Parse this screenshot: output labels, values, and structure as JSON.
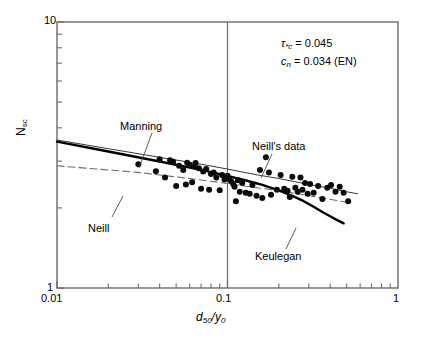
{
  "chart_data": {
    "type": "scatter",
    "title": "",
    "xlabel": "d50/y0",
    "ylabel": "Nsc",
    "xscale": "log",
    "yscale": "log",
    "xlim": [
      0.01,
      1
    ],
    "ylim": [
      1,
      10
    ],
    "grid": false,
    "xticklabels": [
      "0.01",
      "0.1",
      "1"
    ],
    "yticklabels": [
      "10",
      "1"
    ],
    "vertical_reference_line": 0.1,
    "legend_position": "inline-annotations",
    "series": [
      {
        "name": "Neill's data",
        "style": "scatter",
        "marker": "filled-circle",
        "points": [
          [
            0.03,
            2.92
          ],
          [
            0.038,
            2.75
          ],
          [
            0.04,
            3.05
          ],
          [
            0.043,
            2.6
          ],
          [
            0.046,
            3.02
          ],
          [
            0.048,
            2.98
          ],
          [
            0.05,
            2.42
          ],
          [
            0.052,
            2.88
          ],
          [
            0.055,
            2.78
          ],
          [
            0.057,
            2.45
          ],
          [
            0.058,
            2.96
          ],
          [
            0.06,
            2.9
          ],
          [
            0.062,
            2.5
          ],
          [
            0.064,
            2.86
          ],
          [
            0.065,
            2.95
          ],
          [
            0.068,
            2.82
          ],
          [
            0.07,
            2.36
          ],
          [
            0.072,
            2.74
          ],
          [
            0.075,
            2.8
          ],
          [
            0.078,
            2.34
          ],
          [
            0.08,
            2.68
          ],
          [
            0.083,
            2.72
          ],
          [
            0.086,
            2.6
          ],
          [
            0.09,
            2.33
          ],
          [
            0.093,
            2.66
          ],
          [
            0.096,
            2.56
          ],
          [
            0.098,
            2.62
          ],
          [
            0.1,
            2.64
          ],
          [
            0.102,
            2.58
          ],
          [
            0.105,
            2.52
          ],
          [
            0.108,
            2.46
          ],
          [
            0.11,
            2.4
          ],
          [
            0.112,
            2.12
          ],
          [
            0.115,
            2.54
          ],
          [
            0.118,
            2.3
          ],
          [
            0.122,
            2.48
          ],
          [
            0.128,
            2.28
          ],
          [
            0.135,
            2.26
          ],
          [
            0.14,
            2.44
          ],
          [
            0.148,
            2.22
          ],
          [
            0.155,
            2.78
          ],
          [
            0.16,
            2.18
          ],
          [
            0.168,
            3.1
          ],
          [
            0.175,
            2.72
          ],
          [
            0.18,
            2.24
          ],
          [
            0.195,
            2.34
          ],
          [
            0.205,
            2.66
          ],
          [
            0.215,
            2.36
          ],
          [
            0.225,
            2.32
          ],
          [
            0.232,
            2.2
          ],
          [
            0.24,
            2.62
          ],
          [
            0.25,
            2.38
          ],
          [
            0.258,
            2.3
          ],
          [
            0.268,
            2.6
          ],
          [
            0.275,
            2.34
          ],
          [
            0.285,
            2.48
          ],
          [
            0.295,
            2.26
          ],
          [
            0.305,
            2.46
          ],
          [
            0.32,
            2.28
          ],
          [
            0.34,
            2.42
          ],
          [
            0.36,
            2.16
          ],
          [
            0.385,
            2.38
          ],
          [
            0.405,
            2.44
          ],
          [
            0.43,
            2.3
          ],
          [
            0.455,
            2.4
          ],
          [
            0.48,
            2.28
          ],
          [
            0.51,
            2.12
          ]
        ]
      },
      {
        "name": "Manning",
        "style": "solid-thin",
        "points": [
          [
            0.01,
            3.6
          ],
          [
            0.02,
            3.34
          ],
          [
            0.04,
            3.1
          ],
          [
            0.07,
            2.92
          ],
          [
            0.1,
            2.8
          ],
          [
            0.15,
            2.66
          ],
          [
            0.2,
            2.58
          ],
          [
            0.3,
            2.45
          ],
          [
            0.4,
            2.37
          ],
          [
            0.5,
            2.3
          ],
          [
            0.58,
            2.26
          ]
        ]
      },
      {
        "name": "Keulegan",
        "style": "solid-thick",
        "points": [
          [
            0.01,
            3.55
          ],
          [
            0.02,
            3.26
          ],
          [
            0.04,
            2.99
          ],
          [
            0.07,
            2.78
          ],
          [
            0.1,
            2.64
          ],
          [
            0.13,
            2.53
          ],
          [
            0.16,
            2.44
          ],
          [
            0.2,
            2.33
          ],
          [
            0.24,
            2.22
          ],
          [
            0.28,
            2.12
          ],
          [
            0.32,
            2.02
          ],
          [
            0.36,
            1.93
          ],
          [
            0.4,
            1.86
          ],
          [
            0.44,
            1.8
          ],
          [
            0.48,
            1.75
          ]
        ]
      },
      {
        "name": "Neill",
        "style": "dashed",
        "points": [
          [
            0.01,
            2.88
          ],
          [
            0.03,
            2.72
          ],
          [
            0.06,
            2.58
          ],
          [
            0.1,
            2.47
          ],
          [
            0.15,
            2.38
          ],
          [
            0.2,
            2.32
          ],
          [
            0.28,
            2.24
          ],
          [
            0.36,
            2.18
          ],
          [
            0.44,
            2.13
          ],
          [
            0.5,
            2.1
          ]
        ]
      }
    ],
    "annotations": [
      {
        "name": "tau-star-c",
        "text": "τ*c = 0.045"
      },
      {
        "name": "c-n",
        "text": "cn = 0.034 (EN)"
      }
    ]
  },
  "axes": {
    "x": {
      "label_prefix": "d",
      "label_sub1": "50",
      "label_mid": "/y",
      "label_sub2": "0",
      "tick_min": "0.01",
      "tick_mid": "0.1",
      "tick_max": "1"
    },
    "y": {
      "label_prefix": "N",
      "label_sub": "sc",
      "tick_max": "10",
      "tick_min": "1"
    }
  },
  "labels": {
    "manning": "Manning",
    "neill_curve": "Neill",
    "neills_data": "Neill's data",
    "keulegan": "Keulegan"
  },
  "annotation": {
    "tau_symbol": "τ",
    "tau_sub": "*c",
    "tau_value": " = 0.045",
    "c_symbol": "c",
    "c_sub": "n",
    "c_value": " = 0.034 (EN)"
  },
  "colors": {
    "axis": "#6b6b6b",
    "data_point": "#0a0a0a",
    "manning_line": "#3a3a3a",
    "keulegan_line": "#000000",
    "neill_line": "#6b6b6b",
    "background": "#ffffff",
    "text": "#000000"
  }
}
